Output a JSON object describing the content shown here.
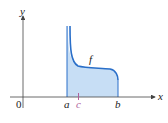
{
  "diagram": {
    "labels": {
      "y_axis": "y",
      "x_axis": "x",
      "origin": "0",
      "a": "a",
      "c": "c",
      "b": "b",
      "function": "f"
    },
    "colors": {
      "axis": "#333333",
      "curve": "#2a6fc9",
      "fill": "#c7def5",
      "c_tick": "#b0609a"
    }
  }
}
